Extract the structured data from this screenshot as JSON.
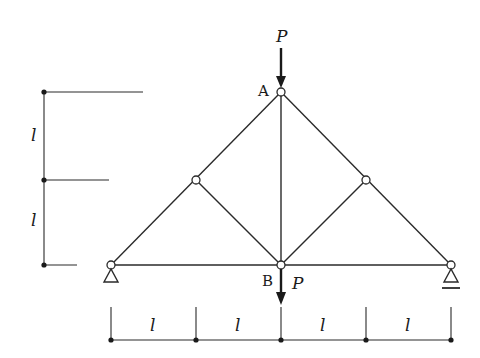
{
  "diagram": {
    "type": "truss",
    "nodes": {
      "A": {
        "label": "A"
      },
      "B": {
        "label": "B"
      }
    },
    "loads": {
      "top": {
        "label": "P"
      },
      "bottom": {
        "label": "P"
      }
    },
    "dimensions": {
      "vertical": [
        "l",
        "l"
      ],
      "horizontal": [
        "l",
        "l",
        "l",
        "l"
      ]
    },
    "supports": {
      "left": "pin",
      "right": "roller"
    },
    "colors": {
      "stroke": "#2a2a2a",
      "background": "#ffffff"
    }
  }
}
